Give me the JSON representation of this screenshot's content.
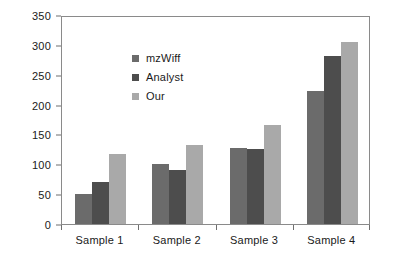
{
  "chart_data": {
    "type": "bar",
    "title": "",
    "subtitle": "",
    "xlabel": "",
    "ylabel": "",
    "categories": [
      "Sample 1",
      "Sample 2",
      "Sample 3",
      "Sample 4"
    ],
    "series": [
      {
        "name": "mzWiff",
        "color": "#6b6b6b",
        "values": [
          50,
          100,
          128,
          222
        ]
      },
      {
        "name": "Analyst",
        "color": "#4d4d4d",
        "values": [
          70,
          90,
          125,
          282
        ]
      },
      {
        "name": "Our",
        "color": "#a9a9a9",
        "values": [
          117,
          132,
          166,
          305
        ]
      }
    ],
    "ylim": [
      0,
      350
    ],
    "ytick_values": [
      0,
      50,
      100,
      150,
      200,
      250,
      300,
      350
    ],
    "ytick_labels": [
      "0",
      "50",
      "100",
      "150",
      "200",
      "250",
      "300",
      "350"
    ],
    "grid": false,
    "legend_position": "inside-top-left",
    "frame": true,
    "axis_color": "#8a8a8a",
    "text_color": "#1a1a1a",
    "background": "#ffffff"
  }
}
